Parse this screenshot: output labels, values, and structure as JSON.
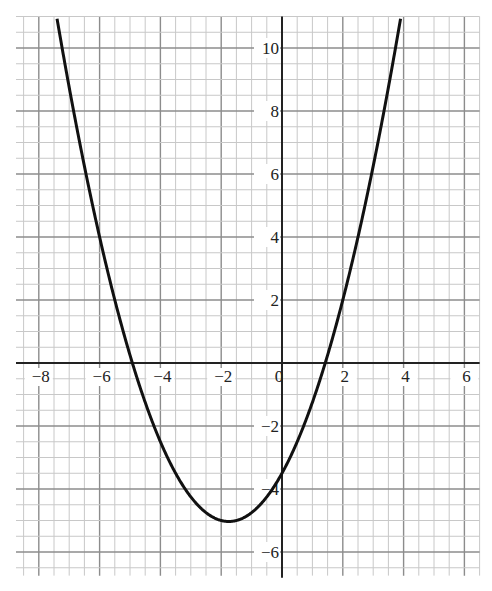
{
  "chart_data": {
    "type": "line",
    "title": "",
    "xlabel": "",
    "ylabel": "",
    "xlim": [
      -8.75,
      6.5
    ],
    "ylim": [
      -6.75,
      11
    ],
    "grid": true,
    "grid_minor_step": 0.5,
    "grid_major_step": 2,
    "x_ticks": [
      -8,
      -6,
      -4,
      -2,
      0,
      2,
      4,
      6
    ],
    "y_ticks": [
      10,
      8,
      6,
      4,
      2,
      -2,
      -4,
      -6
    ],
    "x_tick_labels": [
      "−8",
      "−6",
      "−4",
      "−2",
      "0",
      "2",
      "4",
      "6"
    ],
    "y_tick_labels": [
      "10",
      "8",
      "6",
      "4",
      "2",
      "−2",
      "−4",
      "−6"
    ],
    "series": [
      {
        "name": "parabola",
        "equation": "y = 0.5x² + 1.75x − 3.5",
        "coefficients": {
          "a": 0.5,
          "b": 1.75,
          "c": -3.5
        },
        "vertex": [
          -1.75,
          -5.03
        ],
        "roots": [
          -4.92,
          1.42
        ],
        "y_intercept": -3.5,
        "x": [
          -7.5,
          -7,
          -6,
          -5,
          -4,
          -3,
          -2,
          -1.75,
          -1,
          0,
          1,
          2,
          3,
          3.9
        ],
        "y": [
          11.5,
          8.75,
          4.5,
          1.25,
          -3.0,
          -4.25,
          -5.0,
          -5.03,
          -4.75,
          -3.5,
          -1.25,
          2.0,
          6.25,
          10.93
        ]
      }
    ],
    "legend": null,
    "colors": {
      "curve": "#111111",
      "grid_minor": "#c8c8c8",
      "grid_major": "#8c8c8c",
      "axes": "#222222"
    }
  }
}
